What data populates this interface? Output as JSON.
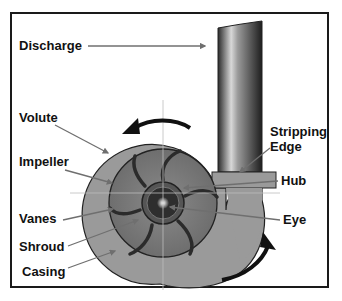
{
  "diagram": {
    "labels": {
      "discharge": "Discharge",
      "volute": "Volute",
      "impeller": "Impeller",
      "vanes": "Vanes",
      "shroud": "Shroud",
      "casing": "Casing",
      "stripping_edge_line1": "Stripping",
      "stripping_edge_line2": "Edge",
      "hub": "Hub",
      "eye": "Eye"
    },
    "colors": {
      "frame": "#1a1a1a",
      "casing_fill": "#9a9a9a",
      "impeller_fill": "#7d7d7d",
      "vane": "#2b2b2b",
      "hub": "#3a3a3a",
      "leader_line": "#6f6f6f",
      "rotation_arrow": "#111111"
    }
  }
}
